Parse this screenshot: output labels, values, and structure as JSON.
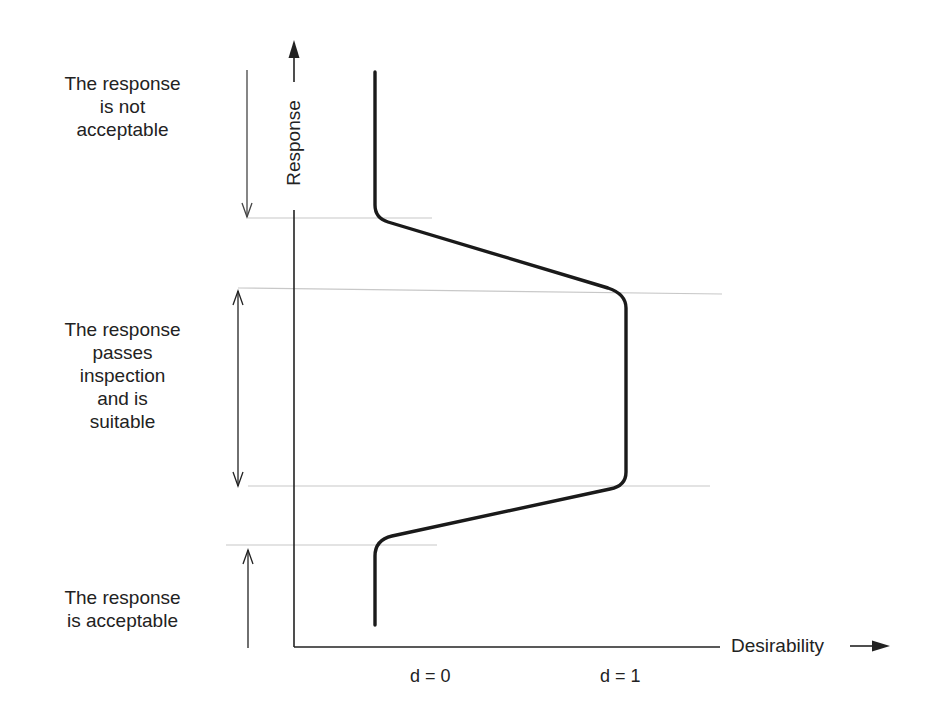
{
  "diagram": {
    "y_axis_label": "Response",
    "x_axis_label": "Desirability",
    "ticks": [
      {
        "label": "d = 0"
      },
      {
        "label": "d = 1"
      }
    ],
    "zones": [
      {
        "lines": [
          "The response",
          "is not",
          "acceptable"
        ]
      },
      {
        "lines": [
          "The response",
          "passes",
          "inspection",
          "and is",
          "suitable"
        ]
      },
      {
        "lines": [
          "The response",
          "is acceptable"
        ]
      }
    ],
    "colors": {
      "curve": "#1a1a1a",
      "guide_lines": "#c8c8c8",
      "axes": "#222222"
    }
  }
}
